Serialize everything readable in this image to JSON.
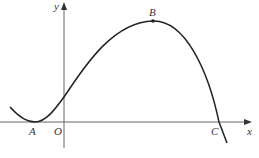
{
  "figure": {
    "type": "function-graph",
    "axes": {
      "x_label": "x",
      "y_label": "y",
      "origin_label": "O"
    },
    "points": {
      "A": {
        "label": "A",
        "role": "local minimum on x-axis (tangent point)"
      },
      "B": {
        "label": "B",
        "role": "local maximum"
      },
      "C": {
        "label": "C",
        "role": "x-intercept"
      }
    },
    "colors": {
      "curve": "#222222",
      "axes": "#555555",
      "labels": "#333333"
    }
  }
}
